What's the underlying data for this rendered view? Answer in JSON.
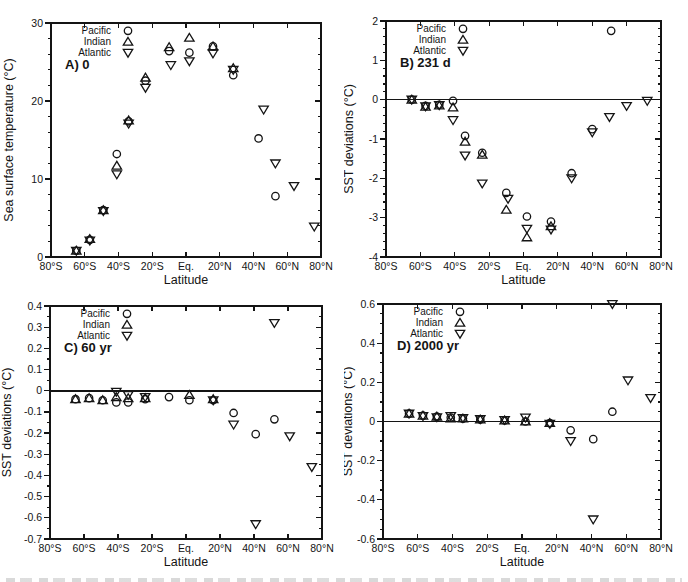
{
  "figure": {
    "background": "#ffffff",
    "ink": "#141414",
    "xlabel": "Latitude",
    "legend_entries": [
      {
        "label": "Pacific",
        "marker": "circle"
      },
      {
        "label": "Indian",
        "marker": "triangle-up"
      },
      {
        "label": "Atlantic",
        "marker": "triangle-down"
      }
    ]
  },
  "chart_data": [
    {
      "id": "A",
      "type": "scatter",
      "title": "A) 0",
      "ylabel": "Sea surface temperature (°C)",
      "xlabel": "Latitude",
      "xlim": [
        -80,
        80
      ],
      "ylim": [
        0,
        30
      ],
      "yticks": [
        0,
        10,
        20,
        30
      ],
      "ytick_labels": [
        "0",
        "10",
        "20",
        "30"
      ],
      "yminor_step": 2,
      "xticks": [
        -80,
        -60,
        -40,
        -20,
        0,
        20,
        40,
        60,
        80
      ],
      "xtick_labels": [
        "80°S",
        "60°S",
        "40°S",
        "20°S",
        "Eq.",
        "20°N",
        "40°N",
        "60°N",
        "80°N"
      ],
      "zero_line": false,
      "legend": [
        "Pacific",
        "Indian",
        "Atlantic"
      ],
      "series": [
        {
          "name": "Pacific",
          "marker": "circle",
          "points": [
            [
              -65,
              0.8
            ],
            [
              -57,
              2.2
            ],
            [
              -49,
              6.0
            ],
            [
              -41,
              13.2
            ],
            [
              -34,
              17.4
            ],
            [
              -24,
              22.6
            ],
            [
              -10,
              26.4
            ],
            [
              2,
              26.2
            ],
            [
              16,
              27.0
            ],
            [
              28,
              23.3
            ],
            [
              43,
              15.2
            ],
            [
              53,
              7.8
            ]
          ]
        },
        {
          "name": "Indian",
          "marker": "triangle-up",
          "points": [
            [
              -65,
              0.8
            ],
            [
              -57,
              2.3
            ],
            [
              -49,
              6.0
            ],
            [
              -41,
              11.7
            ],
            [
              -34,
              17.5
            ],
            [
              -24,
              23.0
            ],
            [
              -10,
              26.9
            ],
            [
              2,
              28.1
            ],
            [
              16,
              27.0
            ],
            [
              28,
              24.2
            ]
          ]
        },
        {
          "name": "Atlantic",
          "marker": "triangle-down",
          "points": [
            [
              -65,
              0.8
            ],
            [
              -57,
              2.1
            ],
            [
              -49,
              5.9
            ],
            [
              -41,
              10.6
            ],
            [
              -34,
              17.1
            ],
            [
              -24,
              21.7
            ],
            [
              -9,
              24.6
            ],
            [
              2,
              25.1
            ],
            [
              16,
              26.1
            ],
            [
              28,
              24.0
            ],
            [
              46,
              18.9
            ],
            [
              53,
              12.0
            ],
            [
              64,
              9.1
            ],
            [
              76,
              3.9
            ]
          ]
        }
      ]
    },
    {
      "id": "B",
      "type": "scatter",
      "title": "B) 231 d",
      "ylabel": "SST deviations (°C)",
      "xlabel": "Latitude",
      "xlim": [
        -80,
        80
      ],
      "ylim": [
        -4,
        2
      ],
      "yticks": [
        -4,
        -3,
        -2,
        -1,
        0,
        1,
        2
      ],
      "ytick_labels": [
        "-4",
        "-3",
        "-2",
        "-1",
        "0",
        "1",
        "2"
      ],
      "yminor_step": 0.2,
      "xticks": [
        -80,
        -60,
        -40,
        -20,
        0,
        20,
        40,
        60,
        80
      ],
      "xtick_labels": [
        "80°S",
        "60°S",
        "40°S",
        "20°S",
        "Eq.",
        "20°N",
        "40°N",
        "60°N",
        "80°N"
      ],
      "zero_line": true,
      "legend": [
        "Pacific",
        "Indian",
        "Atlantic"
      ],
      "series": [
        {
          "name": "Pacific",
          "marker": "circle",
          "points": [
            [
              -65,
              0.0
            ],
            [
              -57,
              -0.16
            ],
            [
              -49,
              -0.13
            ],
            [
              -41,
              -0.03
            ],
            [
              -34,
              -0.92
            ],
            [
              -24,
              -1.35
            ],
            [
              -10,
              -2.37
            ],
            [
              2,
              -2.97
            ],
            [
              16,
              -3.1
            ],
            [
              28,
              -1.87
            ],
            [
              40,
              -0.75
            ],
            [
              51,
              1.75
            ]
          ]
        },
        {
          "name": "Indian",
          "marker": "triangle-up",
          "points": [
            [
              -65,
              0.0
            ],
            [
              -57,
              -0.18
            ],
            [
              -49,
              -0.15
            ],
            [
              -41,
              -0.2
            ],
            [
              -34,
              -1.07
            ],
            [
              -24,
              -1.4
            ],
            [
              -10,
              -2.8
            ],
            [
              2,
              -3.5
            ],
            [
              16,
              -3.22
            ]
          ]
        },
        {
          "name": "Atlantic",
          "marker": "triangle-down",
          "points": [
            [
              -65,
              0.0
            ],
            [
              -57,
              -0.17
            ],
            [
              -49,
              -0.14
            ],
            [
              -41,
              -0.52
            ],
            [
              -34,
              -1.42
            ],
            [
              -24,
              -2.13
            ],
            [
              -9,
              -2.52
            ],
            [
              2,
              -3.28
            ],
            [
              16,
              -3.3
            ],
            [
              28,
              -2.0
            ],
            [
              40,
              -0.83
            ],
            [
              50,
              -0.44
            ],
            [
              60,
              -0.16
            ],
            [
              72,
              -0.03
            ]
          ]
        }
      ]
    },
    {
      "id": "C",
      "type": "scatter",
      "title": "C) 60 yr",
      "ylabel": "SST deviations (°C)",
      "xlabel": "Latitude",
      "xlim": [
        -80,
        80
      ],
      "ylim": [
        -0.7,
        0.4
      ],
      "yticks": [
        -0.7,
        -0.6,
        -0.5,
        -0.4,
        -0.3,
        -0.2,
        -0.1,
        0,
        0.1,
        0.2,
        0.3,
        0.4
      ],
      "ytick_labels": [
        "-0.7",
        "-0.6",
        "-0.5",
        "-0.4",
        "-0.3",
        "-0.2",
        "-0.1",
        "0",
        "0.1",
        "0.2",
        "0.3",
        "0.4"
      ],
      "yminor_step": 0.05,
      "xticks": [
        -80,
        -60,
        -40,
        -20,
        0,
        20,
        40,
        60,
        80
      ],
      "xtick_labels": [
        "80°S",
        "60°S",
        "40°S",
        "20°S",
        "Eq.",
        "20°N",
        "40°N",
        "60°N",
        "80°N"
      ],
      "zero_line": true,
      "legend": [
        "Pacific",
        "Indian",
        "Atlantic"
      ],
      "series": [
        {
          "name": "Pacific",
          "marker": "circle",
          "points": [
            [
              -65,
              -0.04
            ],
            [
              -57,
              -0.035
            ],
            [
              -49,
              -0.045
            ],
            [
              -41,
              -0.055
            ],
            [
              -34,
              -0.055
            ],
            [
              -24,
              -0.04
            ],
            [
              -10,
              -0.03
            ],
            [
              2,
              -0.045
            ],
            [
              16,
              -0.045
            ],
            [
              28,
              -0.105
            ],
            [
              41,
              -0.205
            ],
            [
              52,
              -0.135
            ]
          ]
        },
        {
          "name": "Indian",
          "marker": "triangle-up",
          "points": [
            [
              -65,
              -0.04
            ],
            [
              -57,
              -0.035
            ],
            [
              -49,
              -0.045
            ],
            [
              -41,
              -0.03
            ],
            [
              -34,
              -0.035
            ],
            [
              -24,
              -0.035
            ],
            [
              2,
              -0.02
            ],
            [
              16,
              -0.04
            ]
          ]
        },
        {
          "name": "Atlantic",
          "marker": "triangle-down",
          "points": [
            [
              -41,
              -0.005
            ],
            [
              -34,
              -0.02
            ],
            [
              -24,
              -0.03
            ],
            [
              16,
              -0.045
            ],
            [
              28,
              -0.16
            ],
            [
              41,
              -0.63
            ],
            [
              52,
              0.32
            ],
            [
              61,
              -0.215
            ],
            [
              74,
              -0.36
            ]
          ]
        }
      ]
    },
    {
      "id": "D",
      "type": "scatter",
      "title": "D) 2000 yr",
      "ylabel": "SST deviations (°C)",
      "xlabel": "Latitude",
      "xlim": [
        -80,
        80
      ],
      "ylim": [
        -0.6,
        0.6
      ],
      "yticks": [
        -0.6,
        -0.4,
        -0.2,
        0,
        0.2,
        0.4,
        0.6
      ],
      "ytick_labels": [
        "-0.6",
        "-0.4",
        "-0.2",
        "0",
        "0.2",
        "0.4",
        "0.6"
      ],
      "yminor_step": 0.05,
      "xticks": [
        -80,
        -60,
        -40,
        -20,
        0,
        20,
        40,
        60,
        80
      ],
      "xtick_labels": [
        "80°S",
        "60°S",
        "40°S",
        "20°S",
        "Eq.",
        "20°N",
        "40°N",
        "60°N",
        "80°N"
      ],
      "zero_line": true,
      "legend": [
        "Pacific",
        "Indian",
        "Atlantic"
      ],
      "series": [
        {
          "name": "Pacific",
          "marker": "circle",
          "points": [
            [
              -65,
              0.04
            ],
            [
              -57,
              0.03
            ],
            [
              -49,
              0.025
            ],
            [
              -41,
              0.02
            ],
            [
              -34,
              0.015
            ],
            [
              -24,
              0.01
            ],
            [
              -10,
              0.005
            ],
            [
              2,
              0.0
            ],
            [
              16,
              -0.008
            ],
            [
              28,
              -0.045
            ],
            [
              41,
              -0.09
            ],
            [
              52,
              0.05
            ]
          ]
        },
        {
          "name": "Indian",
          "marker": "triangle-up",
          "points": [
            [
              -65,
              0.04
            ],
            [
              -57,
              0.03
            ],
            [
              -49,
              0.025
            ],
            [
              -41,
              0.015
            ],
            [
              -34,
              0.015
            ],
            [
              -24,
              0.01
            ],
            [
              -10,
              0.005
            ],
            [
              2,
              0.0
            ],
            [
              16,
              -0.008
            ]
          ]
        },
        {
          "name": "Atlantic",
          "marker": "triangle-down",
          "points": [
            [
              -65,
              0.04
            ],
            [
              -57,
              0.028
            ],
            [
              -49,
              0.022
            ],
            [
              -41,
              0.028
            ],
            [
              -34,
              0.018
            ],
            [
              -24,
              0.012
            ],
            [
              -10,
              0.008
            ],
            [
              2,
              0.02
            ],
            [
              16,
              -0.012
            ],
            [
              28,
              -0.1
            ],
            [
              41,
              -0.5
            ],
            [
              52,
              0.6
            ],
            [
              61,
              0.21
            ],
            [
              74,
              0.12
            ]
          ]
        }
      ]
    }
  ]
}
